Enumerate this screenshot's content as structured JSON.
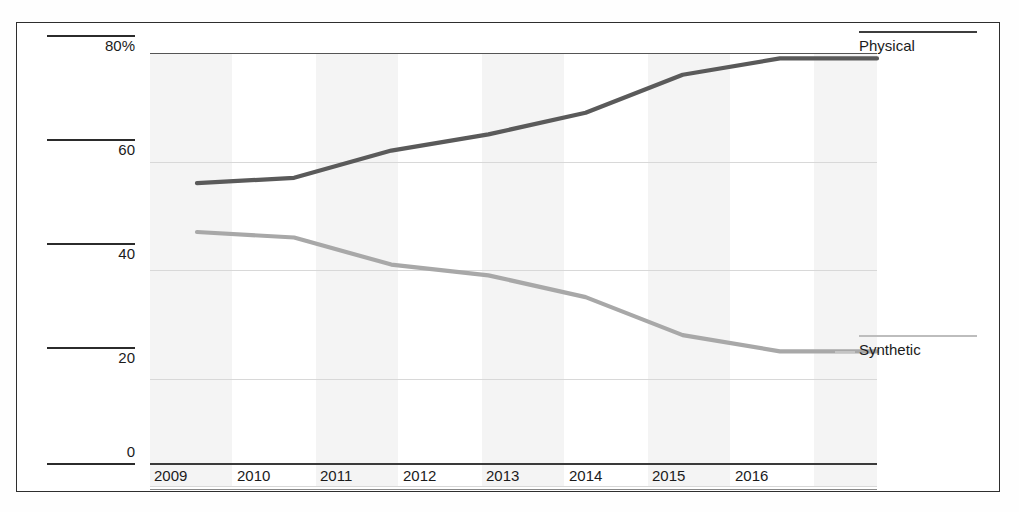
{
  "chart_data": {
    "type": "line",
    "title": "",
    "subtitle": "",
    "xlabel": "",
    "ylabel": "",
    "x": [
      2009,
      2010,
      2011,
      2012,
      2013,
      2014,
      2015,
      2016
    ],
    "categories": [
      "2009",
      "2010",
      "2011",
      "2012",
      "2013",
      "2014",
      "2015",
      "2016"
    ],
    "series": [
      {
        "name": "Physical",
        "color": "#5a5a5a",
        "values": [
          56,
          57,
          62,
          65,
          69,
          76,
          79,
          79
        ]
      },
      {
        "name": "Synthetic",
        "color": "#a8a8a8",
        "values": [
          47,
          46,
          41,
          39,
          35,
          28,
          25,
          25
        ]
      }
    ],
    "ylim": [
      0,
      80
    ],
    "xlim": [
      2009,
      2016
    ],
    "yticks": [
      0,
      20,
      40,
      60,
      80
    ],
    "ytick_labels": [
      "0",
      "20",
      "40",
      "60",
      "80%"
    ],
    "grid": true,
    "grid_axis": "y",
    "legend_position": "right-inline",
    "band_shading": true,
    "units": "percent"
  },
  "axes": {
    "y_labels": [
      "80%",
      "60",
      "40",
      "20",
      "0"
    ],
    "x_labels": [
      "2009",
      "2010",
      "2011",
      "2012",
      "2013",
      "2014",
      "2015",
      "2016"
    ]
  },
  "legend": {
    "physical": "Physical",
    "synthetic": "Synthetic"
  },
  "artifacts": {
    "clipped_caption": ""
  },
  "colors": {
    "physical_line": "#5a5a5a",
    "synthetic_line": "#a8a8a8",
    "gridline": "#d8d8d8",
    "axis": "#2b2b2b",
    "band": "#f4f4f4",
    "frame": "#2e2e2e"
  }
}
